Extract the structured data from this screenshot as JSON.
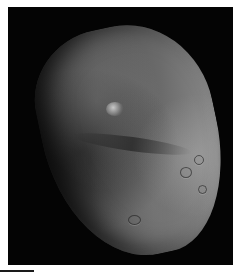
{
  "image": {
    "subject": "comet nucleus",
    "description": "Grayscale photograph of an irregular, cratered comet nucleus against black space",
    "colors": {
      "background": "#ffffff",
      "frame": "#040404",
      "surface_dark": "#2a2a2a",
      "surface_light": "#8a8a8a"
    }
  }
}
